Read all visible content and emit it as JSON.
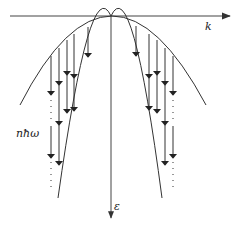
{
  "diagram": {
    "type": "band-structure-energy-relaxation",
    "axes": {
      "horizontal": {
        "label": "k",
        "y": 16,
        "x_start": 10,
        "x_end": 231
      },
      "vertical": {
        "label": "ε",
        "x": 111,
        "y_start": 16,
        "y_end": 219
      }
    },
    "energy_label": "nħω",
    "apex": {
      "x": 111,
      "y": 16
    },
    "curves": [
      {
        "name": "wide-band",
        "left": {
          "x": 20,
          "y": 105
        },
        "right": {
          "x": 206,
          "y": 105
        }
      },
      {
        "name": "narrow-band",
        "left": {
          "x": 58,
          "y": 198
        },
        "right": {
          "x": 162,
          "y": 198
        }
      }
    ],
    "arrows": [
      {
        "side": "left",
        "x": 88,
        "segments": [
          [
            27,
            57
          ]
        ]
      },
      {
        "side": "left",
        "x": 74,
        "segments": [
          [
            34,
            78
          ],
          [
            78,
            111
          ]
        ]
      },
      {
        "side": "left",
        "x": 67,
        "segments": [
          [
            40,
            75
          ],
          [
            75,
            113
          ]
        ]
      },
      {
        "side": "left",
        "x": 59,
        "segments": [
          [
            48,
            85
          ],
          [
            85,
            125
          ],
          [
            125,
            165
          ]
        ]
      },
      {
        "side": "left",
        "x": 51,
        "segments": [
          [
            56,
            95
          ]
        ],
        "dots": [
          [
            100,
            122
          ]
        ],
        "segments2": [
          [
            126,
            158
          ]
        ],
        "dots2": [
          [
            162,
            190
          ]
        ]
      },
      {
        "side": "right",
        "x": 136,
        "segments": [
          [
            26,
            56
          ]
        ]
      },
      {
        "side": "right",
        "x": 149,
        "segments": [
          [
            34,
            78
          ],
          [
            78,
            110
          ]
        ]
      },
      {
        "side": "right",
        "x": 157,
        "segments": [
          [
            40,
            75
          ],
          [
            75,
            113
          ]
        ]
      },
      {
        "side": "right",
        "x": 165,
        "segments": [
          [
            48,
            85
          ],
          [
            85,
            125
          ],
          [
            125,
            165
          ]
        ]
      },
      {
        "side": "right",
        "x": 173,
        "segments": [
          [
            56,
            95
          ]
        ],
        "dots": [
          [
            100,
            122
          ]
        ],
        "segments2": [
          [
            126,
            158
          ]
        ],
        "dots2": [
          [
            162,
            190
          ]
        ]
      }
    ],
    "colors": {
      "stroke": "#333333",
      "background": "#ffffff"
    }
  }
}
